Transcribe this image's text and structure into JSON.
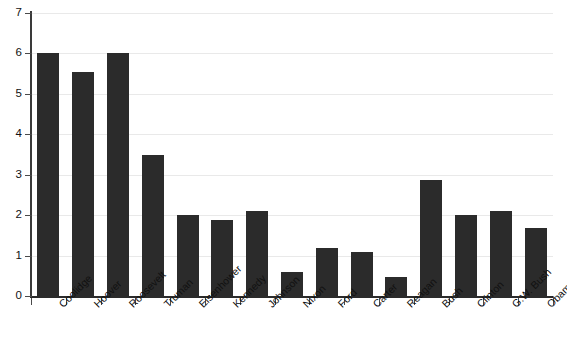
{
  "chart_data": {
    "type": "bar",
    "title": "",
    "subtitle": "",
    "xlabel": "",
    "ylabel": "",
    "ylim": [
      0,
      7
    ],
    "yticks": [
      0,
      1,
      2,
      3,
      4,
      5,
      6,
      7
    ],
    "ytick_labels": [
      "0",
      "1",
      "2",
      "3",
      "4",
      "5",
      "6",
      "7"
    ],
    "grid": true,
    "legend": false,
    "bar_color": "#2b2b2b",
    "background_color": "#ffffff",
    "gridline_color": "#e9e9e9",
    "axis_color": "#2b2b2b",
    "categories": [
      "Coolidge",
      "Hoover",
      "Roosevelt",
      "Truman",
      "Eisenhower",
      "Kennedy",
      "Johnson",
      "Nixon",
      "Ford",
      "Carter",
      "Reagan",
      "Bush",
      "Clinton",
      "G.W. Bush",
      "Obama*"
    ],
    "values": [
      6.0,
      5.55,
      6.0,
      3.48,
      2.0,
      1.87,
      2.1,
      0.6,
      1.19,
      1.1,
      0.47,
      2.88,
      2.0,
      2.1,
      1.67
    ]
  }
}
